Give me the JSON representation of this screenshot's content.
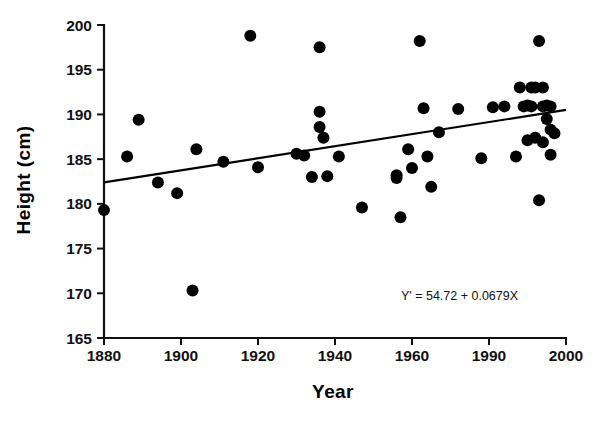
{
  "chart_data": {
    "type": "scatter",
    "title": "",
    "xlabel": "Year",
    "ylabel": "Height (cm)",
    "xlim": [
      1880,
      2000
    ],
    "ylim": [
      165,
      200
    ],
    "grid": false,
    "legend": null,
    "x_ticks": [
      1880,
      1900,
      1920,
      1940,
      1960,
      1990,
      2000
    ],
    "x_tick_labels": [
      "1880",
      "1900",
      "1920",
      "1940",
      "1960",
      "1990",
      "2000"
    ],
    "y_ticks": [
      165,
      170,
      175,
      180,
      185,
      190,
      195,
      200
    ],
    "y_tick_labels": [
      "165",
      "170",
      "175",
      "180",
      "185",
      "190",
      "195",
      "200"
    ],
    "annotation": "Y' = 54.72 + 0.0679X",
    "marker": "filled-circle",
    "marker_color": "#000000",
    "trendline": {
      "label": "least-squares regression line",
      "equation": "Y' = 54.72 + 0.0679X",
      "intercept": 54.72,
      "slope": 0.0679,
      "x_start": 1880,
      "y_start": 182.4,
      "x_end": 2000,
      "y_end": 190.5,
      "color": "#000000"
    },
    "x": [
      1880,
      1886,
      1889,
      1894,
      1899,
      1903,
      1904,
      1911,
      1918,
      1920,
      1930,
      1932,
      1934,
      1936,
      1936,
      1936,
      1937,
      1938,
      1941,
      1947,
      1956,
      1956,
      1957,
      1959,
      1960,
      1962,
      1963,
      1964,
      1965,
      1967,
      1972,
      1978,
      1981,
      1984,
      1987,
      1988,
      1989,
      1990,
      1990,
      1991,
      1991,
      1992,
      1992,
      1993,
      1993,
      1994,
      1994,
      1994,
      1995,
      1995,
      1996,
      1996,
      1996,
      1997
    ],
    "y": [
      179.3,
      185.3,
      189.4,
      182.4,
      181.2,
      170.3,
      186.1,
      184.7,
      198.8,
      184.1,
      185.6,
      185.4,
      183.0,
      197.5,
      190.3,
      188.6,
      187.4,
      183.1,
      185.3,
      179.6,
      183.2,
      182.9,
      178.5,
      186.1,
      184.0,
      198.2,
      190.7,
      185.3,
      181.9,
      188.0,
      190.6,
      185.1,
      190.8,
      190.9,
      185.3,
      193.0,
      190.9,
      191.0,
      187.1,
      193.0,
      190.9,
      193.0,
      187.4,
      198.2,
      180.4,
      193.0,
      190.9,
      186.9,
      191.0,
      189.5,
      190.9,
      188.3,
      185.5,
      187.9
    ],
    "n_points": 54,
    "source_units": "cm"
  },
  "axes": {
    "x_title": "Year",
    "y_title": "Height (cm)"
  }
}
